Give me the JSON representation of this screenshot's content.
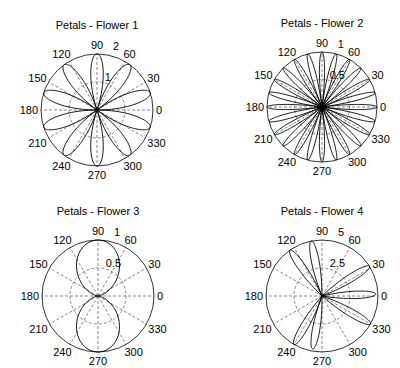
{
  "chart_data": [
    {
      "type": "polar",
      "title": "Petals - Flower 1",
      "center": [
        97,
        110
      ],
      "radius_px": 56,
      "rmax": 2,
      "radial_ticks": [
        1,
        2
      ],
      "radial_tick_angle": 75,
      "angle_ticks": [
        0,
        30,
        60,
        90,
        120,
        150,
        180,
        210,
        240,
        270,
        300,
        330
      ],
      "curve": {
        "formula": "r = |2 sin(5θ)|",
        "amplitude": 2,
        "petals": 10,
        "petal_angles_deg": [
          18,
          54,
          90,
          126,
          162,
          198,
          234,
          270,
          306,
          342
        ],
        "petal_halfwidth_deg": 18,
        "shape_power": 1
      },
      "grid": true
    },
    {
      "type": "polar",
      "title": "Petals - Flower 2",
      "center": [
        322,
        107
      ],
      "radius_px": 55,
      "rmax": 1,
      "radial_ticks": [
        0.5,
        1
      ],
      "radial_tick_angle": 75,
      "angle_ticks": [
        0,
        30,
        60,
        90,
        120,
        150,
        180,
        210,
        240,
        270,
        300,
        330
      ],
      "curve": {
        "formula": "r = |cos(12θ)|",
        "amplitude": 1,
        "petals": 24,
        "petal_angles_deg": [
          0,
          15,
          30,
          45,
          60,
          75,
          90,
          105,
          120,
          135,
          150,
          165,
          180,
          195,
          210,
          225,
          240,
          255,
          270,
          285,
          300,
          315,
          330,
          345
        ],
        "petal_halfwidth_deg": 7.5,
        "shape_power": 1
      },
      "grid": true
    },
    {
      "type": "polar",
      "title": "Petals - Flower 3",
      "center": [
        98,
        296
      ],
      "radius_px": 56,
      "rmax": 1,
      "radial_ticks": [
        0.5,
        1
      ],
      "radial_tick_angle": 75,
      "angle_ticks": [
        0,
        30,
        60,
        90,
        120,
        150,
        180,
        210,
        240,
        270,
        300,
        330
      ],
      "curve": {
        "formula": "r = sin²(θ)",
        "amplitude": 1,
        "petals": 2,
        "petal_angles_deg": [
          90,
          270
        ],
        "petal_halfwidth_deg": 90,
        "shape_power": 2
      },
      "grid": true
    },
    {
      "type": "polar",
      "title": "Petals - Flower 4",
      "center": [
        322,
        296
      ],
      "radius_px": 56,
      "rmax": 5,
      "radial_ticks": [
        2.5,
        5
      ],
      "radial_tick_angle": 75,
      "angle_ticks": [
        0,
        30,
        60,
        90,
        120,
        150,
        180,
        210,
        240,
        270,
        300,
        330
      ],
      "curve": {
        "formula": "7 petals",
        "amplitude": 5,
        "petals": 7,
        "petal_angles_deg": [
          330,
          2,
          32,
          101,
          125,
          240,
          260
        ],
        "petal_amplitudes": [
          5,
          4.8,
          5,
          5,
          5,
          5,
          4.8
        ],
        "petal_halfwidth_deg": 11,
        "shape_power": 1
      },
      "grid": true
    }
  ]
}
